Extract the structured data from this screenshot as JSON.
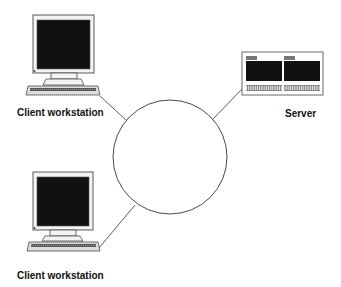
{
  "diagram": {
    "nodes": [
      {
        "id": "client-1",
        "type": "client-workstation",
        "label": "Client workstation"
      },
      {
        "id": "server",
        "type": "server",
        "label": "Server"
      },
      {
        "id": "client-2",
        "type": "client-workstation",
        "label": "Client workstation"
      },
      {
        "id": "network",
        "type": "network-cloud",
        "label": ""
      }
    ],
    "edges": [
      {
        "from": "client-1",
        "to": "network"
      },
      {
        "from": "server",
        "to": "network"
      },
      {
        "from": "client-2",
        "to": "network"
      }
    ]
  },
  "colors": {
    "stroke": "#222222",
    "screen": "#111111",
    "case": "#f4f4f4"
  }
}
